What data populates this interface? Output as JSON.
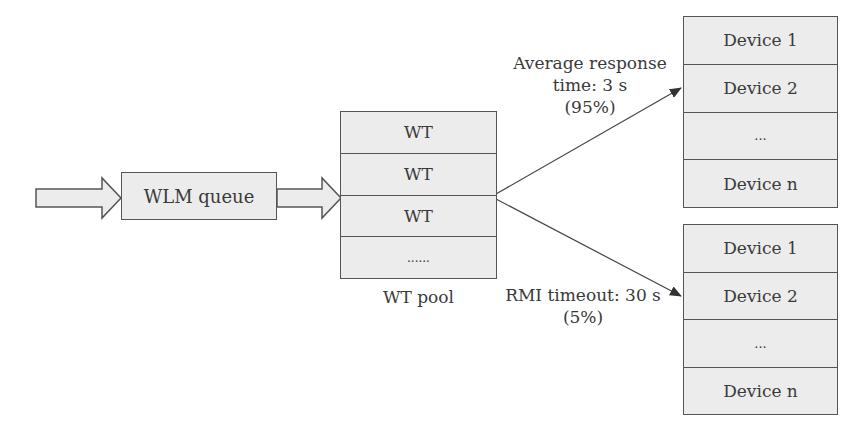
{
  "queue": {
    "label": "WLM queue"
  },
  "pool": {
    "caption": "WT pool",
    "rows": [
      "WT",
      "WT",
      "WT",
      "......"
    ]
  },
  "device_groups": [
    {
      "rows": [
        "Device 1",
        "Device 2",
        "...",
        "Device n"
      ]
    },
    {
      "rows": [
        "Device 1",
        "Device 2",
        "...",
        "Device n"
      ]
    }
  ],
  "edges": {
    "top": {
      "line1": "Average response",
      "line2": "time: 3 s",
      "line3": "(95%)"
    },
    "bottom": {
      "line1": "RMI timeout: 30 s",
      "line2": "(5%)"
    }
  }
}
